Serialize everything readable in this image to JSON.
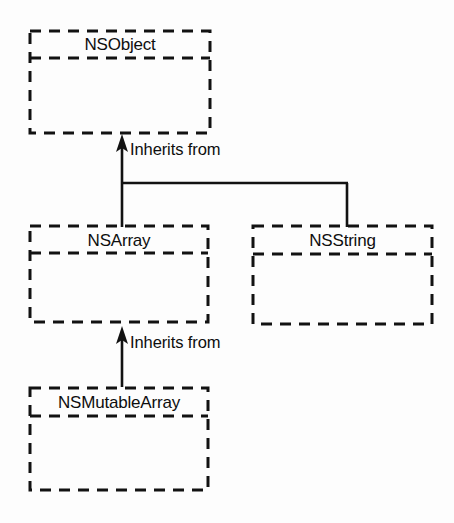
{
  "diagram": {
    "ink_color": "#121212",
    "background_color": "#fdfdfd",
    "nodes": [
      {
        "id": "nsobject",
        "label": "NSObject",
        "x": 30,
        "y": 31,
        "width": 180,
        "height": 102,
        "divider_y": 58
      },
      {
        "id": "nsarray",
        "label": "NSArray",
        "x": 30,
        "y": 226,
        "width": 178,
        "height": 96,
        "divider_y": 253
      },
      {
        "id": "nsstring",
        "label": "NSString",
        "x": 253,
        "y": 226,
        "width": 179,
        "height": 98,
        "divider_y": 254
      },
      {
        "id": "nsmutablearray",
        "label": "NSMutableArray",
        "x": 30,
        "y": 388,
        "width": 178,
        "height": 102,
        "divider_y": 416
      }
    ],
    "edges": [
      {
        "id": "nsarray-to-nsobject",
        "label": "Inherits from",
        "from": "nsarray",
        "to": "nsobject",
        "label_x": 130,
        "label_y": 141
      },
      {
        "id": "nsstring-to-nsobject",
        "label": "",
        "from": "nsstring",
        "to": "nsobject"
      },
      {
        "id": "nsmutablearray-to-nsarray",
        "label": "Inherits from",
        "from": "nsmutablearray",
        "to": "nsarray",
        "label_x": 130,
        "label_y": 334
      }
    ]
  }
}
